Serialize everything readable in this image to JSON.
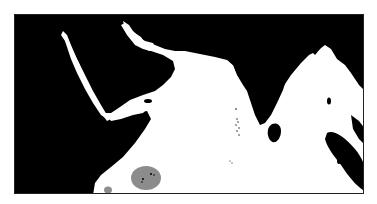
{
  "map": {
    "region": "Indian Ocean (Arabian Sea, Red Sea, Persian Gulf, Bay of Bengal)",
    "colors": {
      "land": "#000000",
      "water": "#ffffff",
      "highlight_zone": "#8c8c8c",
      "frame": "#222222"
    },
    "features": [
      {
        "name": "red-sea",
        "type": "water"
      },
      {
        "name": "persian-gulf",
        "type": "water"
      },
      {
        "name": "gulf-of-aden",
        "type": "water"
      },
      {
        "name": "arabian-sea",
        "type": "water"
      },
      {
        "name": "bay-of-bengal",
        "type": "water"
      },
      {
        "name": "andaman-sea",
        "type": "water"
      },
      {
        "name": "socotra",
        "type": "island"
      },
      {
        "name": "sri-lanka",
        "type": "island"
      },
      {
        "name": "andaman-islands",
        "type": "island"
      },
      {
        "name": "sumatra",
        "type": "island"
      },
      {
        "name": "lakshadweep",
        "type": "island-group"
      },
      {
        "name": "maldives",
        "type": "island-group"
      },
      {
        "name": "seychelles-zone",
        "type": "highlighted-area"
      },
      {
        "name": "small-highlight-zone",
        "type": "highlighted-area"
      }
    ]
  }
}
